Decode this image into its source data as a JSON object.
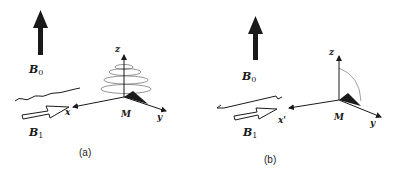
{
  "panels": [
    {
      "caption": "(a)",
      "labels": {
        "b0": "B",
        "b0_sub": "0",
        "b1": "B",
        "b1_sub": "1",
        "x": "x",
        "y": "y",
        "z": "z",
        "m": "M"
      },
      "description": "Magnetization M precessing about z axis while B1 applied along x"
    },
    {
      "caption": "(b)",
      "labels": {
        "b0": "B",
        "b0_sub": "0",
        "b1": "B",
        "b1_sub": "1",
        "x": "x'",
        "y": "y",
        "z": "z",
        "m": "M"
      },
      "description": "Rotating frame: M tipped from z toward y by B1 along x'"
    }
  ],
  "colors": {
    "ink": "#1a1a1a",
    "spiral": "#555555",
    "background": "#ffffff"
  }
}
